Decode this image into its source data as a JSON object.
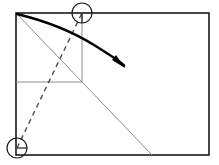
{
  "canvas": {
    "width": 219,
    "height": 165,
    "background": "#ffffff"
  },
  "colors": {
    "outline": "#1a1a1a",
    "construction": "#8c8c8c",
    "dashed": "#4d4d4d",
    "arrow": "#000000",
    "marker": "#1a1a1a"
  },
  "diagram": {
    "type": "geometric-construction",
    "frame": {
      "name": "outer-rectangle",
      "x": 16,
      "y": 13,
      "width": 193,
      "height": 142,
      "stroke_width": 1.6
    },
    "construction_lines": [
      {
        "name": "diagonal-line",
        "x1": 16,
        "y1": 13,
        "x2": 152,
        "y2": 155,
        "stroke_width": 1
      },
      {
        "name": "horizontal-line",
        "x1": 16,
        "y1": 82,
        "x2": 82,
        "y2": 82,
        "stroke_width": 1
      },
      {
        "name": "vertical-line",
        "x1": 82,
        "y1": 13,
        "x2": 82,
        "y2": 82,
        "stroke_width": 1
      }
    ],
    "dashed_line": {
      "name": "dashed-connector",
      "x1": 17,
      "y1": 148,
      "x2": 82,
      "y2": 13,
      "stroke_width": 1.4,
      "dash_pattern": "5,4"
    },
    "arrow": {
      "name": "motion-arrow",
      "path": "M 17 14 Q 62 25 94 45 T 124 66",
      "stroke_width": 2.4,
      "head_points": "125,68 112,60 116,55"
    },
    "markers": [
      {
        "name": "top-vertex-marker",
        "cx": 82,
        "cy": 13,
        "r": 10,
        "stroke_width": 1.2,
        "tick": {
          "x1": 82,
          "y1": 13,
          "x2": 82,
          "y2": 23
        }
      },
      {
        "name": "bottom-vertex-marker",
        "cx": 17,
        "cy": 148,
        "r": 10,
        "stroke_width": 1.2,
        "tick": {
          "x1": 17,
          "y1": 148,
          "x2": 27,
          "y2": 148
        }
      }
    ]
  }
}
